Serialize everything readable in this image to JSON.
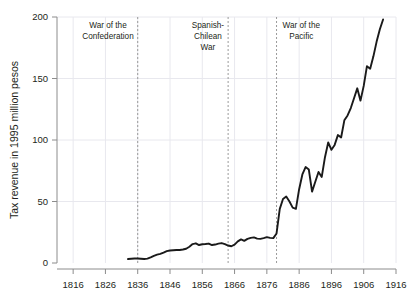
{
  "chart_data": {
    "type": "line",
    "title": "",
    "xlabel": "",
    "ylabel": "Tax revenue in 1995 million pesos",
    "xlim": [
      1811,
      1916
    ],
    "ylim": [
      0,
      200
    ],
    "grid": true,
    "legend": null,
    "xticks": [
      1816,
      1826,
      1836,
      1846,
      1856,
      1866,
      1876,
      1886,
      1896,
      1906,
      1916
    ],
    "xtick_labels": [
      "1816",
      "1826",
      "1836",
      "1846",
      "1856",
      "1866",
      "1876",
      "1886",
      "1896",
      "1906",
      "1916"
    ],
    "yticks": [
      0,
      50,
      100,
      150,
      200
    ],
    "ytick_labels": [
      "0",
      "50",
      "100",
      "150",
      "200"
    ],
    "series": [
      {
        "name": "Tax revenue",
        "color": "#1a1a1a",
        "x": [
          1833,
          1834,
          1835,
          1836,
          1837,
          1838,
          1839,
          1840,
          1841,
          1842,
          1843,
          1844,
          1845,
          1846,
          1847,
          1848,
          1849,
          1850,
          1851,
          1852,
          1853,
          1854,
          1855,
          1856,
          1857,
          1858,
          1859,
          1860,
          1861,
          1862,
          1863,
          1864,
          1865,
          1866,
          1867,
          1868,
          1869,
          1870,
          1871,
          1872,
          1873,
          1874,
          1875,
          1876,
          1877,
          1878,
          1879,
          1880,
          1881,
          1882,
          1883,
          1884,
          1885,
          1886,
          1887,
          1888,
          1889,
          1890,
          1891,
          1892,
          1893,
          1894,
          1895,
          1896,
          1897,
          1898,
          1899,
          1900,
          1901,
          1902,
          1903,
          1904,
          1905,
          1906,
          1907,
          1908,
          1909,
          1910,
          1911,
          1912
        ],
        "values": [
          3.2,
          3.4,
          3.6,
          3.6,
          3.4,
          3.2,
          3.6,
          4.6,
          5.8,
          6.8,
          7.4,
          8.4,
          9.6,
          10.2,
          10.4,
          10.6,
          10.6,
          11.0,
          11.6,
          13.2,
          15.4,
          16.0,
          14.6,
          15.2,
          15.4,
          15.8,
          14.6,
          15.0,
          15.8,
          16.2,
          15.4,
          14.2,
          13.6,
          15.0,
          17.6,
          19.2,
          18.0,
          19.6,
          20.4,
          20.8,
          19.8,
          19.6,
          20.2,
          21.0,
          20.4,
          20.2,
          24.0,
          44.0,
          52.0,
          54.0,
          50.0,
          45.0,
          44.0,
          60.0,
          72.0,
          78.0,
          76.0,
          58.0,
          66.0,
          74.0,
          70.0,
          86.0,
          98.0,
          92.0,
          96.0,
          104.0,
          102.0,
          116.0,
          120.0,
          126.0,
          134.0,
          142.0,
          132.0,
          144.0,
          160.0,
          158.0,
          168.0,
          180.0,
          190.0,
          198.0
        ]
      }
    ],
    "annotations": [
      {
        "label": "War of the\nConfederation",
        "lines": [
          "War of the",
          "Confederation"
        ],
        "x": 1836,
        "align": "right"
      },
      {
        "label": "Spanish-\nChilean\nWar",
        "lines": [
          "Spanish-",
          "Chilean",
          "War"
        ],
        "x": 1864,
        "align": "right"
      },
      {
        "label": "War of the\nPacific",
        "lines": [
          "War of the",
          "Pacific"
        ],
        "x": 1879,
        "align": "left"
      }
    ],
    "event_lines": [
      1836,
      1864,
      1879
    ],
    "colors": {
      "line": "#1a1a1a",
      "axis": "#8c8c8c",
      "grid": "#e8e8ee",
      "event_line": "#9a9a9a",
      "text": "#231f20",
      "background": "#ffffff"
    }
  }
}
